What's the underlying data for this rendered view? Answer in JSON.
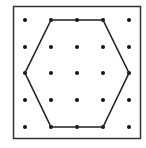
{
  "figure": {
    "frame": {
      "x": 13.5,
      "y": 6.5,
      "width": 127,
      "height": 132,
      "stroke": "#333333",
      "stroke_width": 1.5
    },
    "grid": {
      "cols": [
        25,
        51,
        77,
        103,
        129
      ],
      "rows": [
        20,
        47,
        73,
        100,
        127
      ],
      "dot_radius": 2,
      "dot_color": "#111111"
    },
    "hexagon": {
      "vertices_grid": [
        [
          1,
          0
        ],
        [
          3,
          0
        ],
        [
          4,
          2
        ],
        [
          3,
          4
        ],
        [
          1,
          4
        ],
        [
          0,
          2
        ]
      ],
      "stroke": "#222222",
      "stroke_width": 1.6
    }
  }
}
